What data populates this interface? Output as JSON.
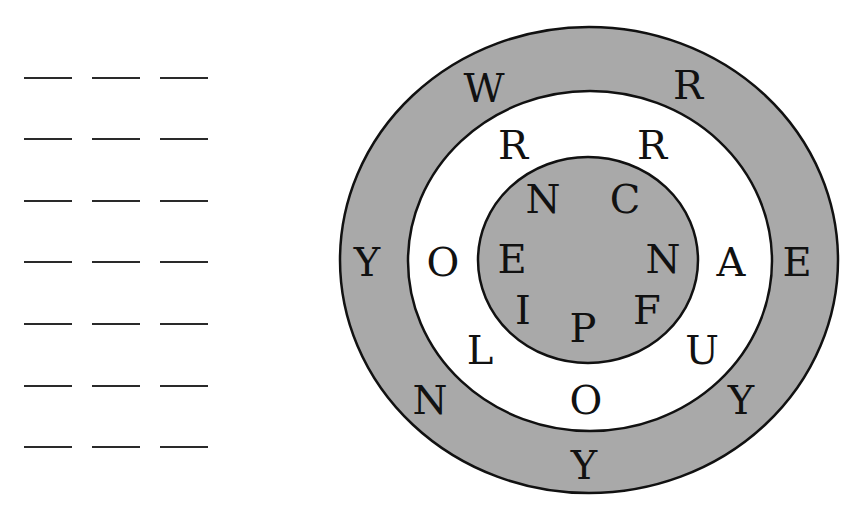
{
  "puzzle": {
    "answer_blanks": {
      "rows": 7,
      "columns": 3,
      "row_y": [
        77,
        138,
        200,
        261,
        323,
        385,
        446
      ],
      "column_x": [
        24,
        92,
        160
      ]
    },
    "colors": {
      "ring_fill": "#a9a9a9",
      "background": "#ffffff",
      "stroke": "#111111",
      "letter": "#111111"
    },
    "rings": {
      "outer": {
        "letters": [
          {
            "char": "W",
            "x": 484,
            "y": 88
          },
          {
            "char": "R",
            "x": 688,
            "y": 85
          },
          {
            "char": "Y",
            "x": 367,
            "y": 262
          },
          {
            "char": "E",
            "x": 797,
            "y": 262
          },
          {
            "char": "N",
            "x": 430,
            "y": 400
          },
          {
            "char": "Y",
            "x": 741,
            "y": 400
          },
          {
            "char": "Y",
            "x": 584,
            "y": 465
          }
        ]
      },
      "middle": {
        "letters": [
          {
            "char": "R",
            "x": 513,
            "y": 145
          },
          {
            "char": "R",
            "x": 652,
            "y": 145
          },
          {
            "char": "O",
            "x": 443,
            "y": 262
          },
          {
            "char": "A",
            "x": 731,
            "y": 262
          },
          {
            "char": "L",
            "x": 480,
            "y": 350
          },
          {
            "char": "U",
            "x": 702,
            "y": 350
          },
          {
            "char": "O",
            "x": 586,
            "y": 400
          }
        ]
      },
      "inner": {
        "letters": [
          {
            "char": "N",
            "x": 543,
            "y": 199
          },
          {
            "char": "C",
            "x": 625,
            "y": 199
          },
          {
            "char": "E",
            "x": 512,
            "y": 259
          },
          {
            "char": "N",
            "x": 663,
            "y": 259
          },
          {
            "char": "I",
            "x": 523,
            "y": 310
          },
          {
            "char": "F",
            "x": 647,
            "y": 310
          },
          {
            "char": "P",
            "x": 583,
            "y": 328
          }
        ]
      }
    }
  }
}
